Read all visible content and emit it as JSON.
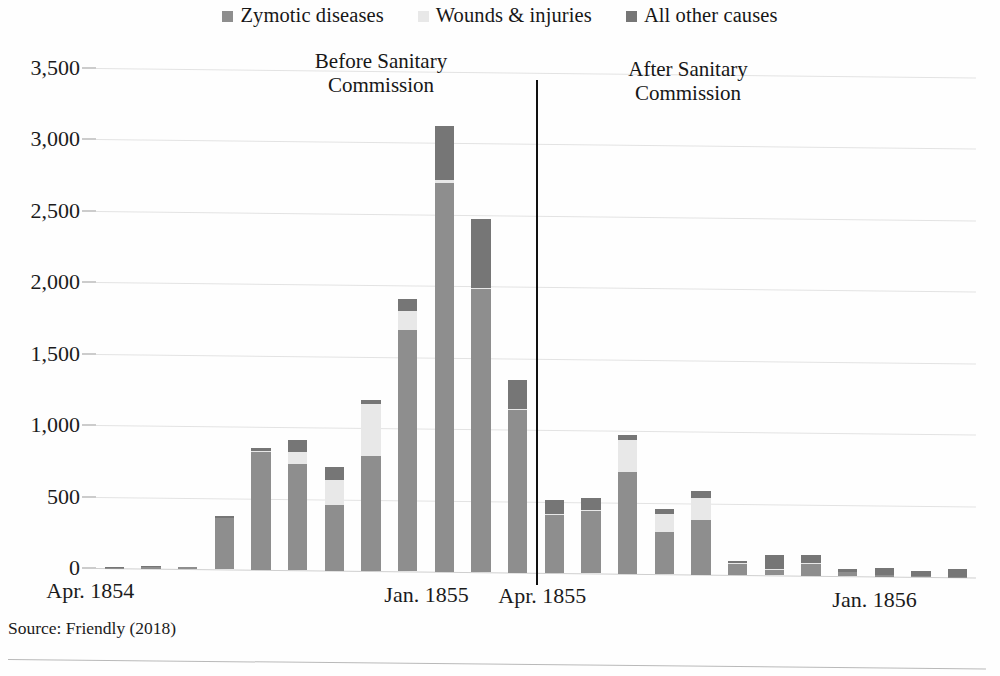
{
  "source_note": "Source: Friendly (2018)",
  "annotations": {
    "before": "Before Sanitary\nCommission",
    "before_line1": "Before Sanitary",
    "before_line2": "Commission",
    "after_line1": "After Sanitary",
    "after_line2": "Commission"
  },
  "colors": {
    "zymotic": "#8e8e8e",
    "wounds": "#e8e8e8",
    "other": "#767676",
    "gridline": "#e3e3e3",
    "divider": "#111111",
    "text": "#1b1b1b"
  },
  "chart_data": {
    "type": "bar",
    "title": "",
    "subtitle": "",
    "xlabel": "",
    "ylabel": "",
    "ylim": [
      0,
      3500
    ],
    "ytick_values": [
      0,
      500,
      1000,
      1500,
      2000,
      2500,
      3000,
      3500
    ],
    "ytick_labels": [
      "0",
      "500",
      "1,000",
      "1,500",
      "2,000",
      "2,500",
      "3,000",
      "3,500"
    ],
    "grid": true,
    "stacked": true,
    "legend_position": "top-center",
    "legend": [
      "Zymotic diseases",
      "Wounds & injuries",
      "All other causes"
    ],
    "categories": [
      "Apr. 1854",
      "May 1854",
      "Jun. 1854",
      "Jul. 1854",
      "Aug. 1854",
      "Sep. 1854",
      "Oct. 1854",
      "Nov. 1854",
      "Dec. 1854",
      "Jan. 1855",
      "Feb. 1855",
      "Mar. 1855",
      "Apr. 1855",
      "May 1855",
      "Jun. 1855",
      "Jul. 1855",
      "Aug. 1855",
      "Sep. 1855",
      "Oct. 1855",
      "Nov. 1855",
      "Dec. 1855",
      "Jan. 1856",
      "Feb. 1856",
      "Mar. 1856"
    ],
    "xtick_labels": [
      "Apr. 1854",
      "Jan. 1855",
      "Apr. 1855",
      "Jan. 1856"
    ],
    "xtick_indices": [
      0,
      9,
      12,
      21
    ],
    "series": [
      {
        "name": "Zymotic diseases",
        "color": "#8e8e8e",
        "values": [
          1,
          12,
          11,
          359,
          828,
          745,
          460,
          806,
          1687,
          2723,
          1981,
          1139,
          409,
          437,
          714,
          298,
          383,
          76,
          37,
          83,
          26,
          10,
          5,
          2
        ]
      },
      {
        "name": "Wounds & injuries",
        "color": "#e8e8e8",
        "values": [
          0,
          0,
          0,
          1,
          4,
          79,
          171,
          366,
          133,
          16,
          11,
          5,
          2,
          2,
          219,
          122,
          156,
          10,
          6,
          4,
          2,
          1,
          1,
          0
        ]
      },
      {
        "name": "All other causes",
        "color": "#767676",
        "values": [
          5,
          9,
          6,
          11,
          19,
          86,
          96,
          24,
          87,
          383,
          477,
          207,
          96,
          83,
          36,
          37,
          43,
          13,
          98,
          56,
          23,
          46,
          33,
          51
        ]
      }
    ],
    "totals": [
      6,
      21,
      17,
      371,
      851,
      910,
      727,
      1196,
      1907,
      3122,
      2469,
      1351,
      507,
      522,
      969,
      457,
      582,
      99,
      141,
      143,
      51,
      57,
      39,
      53
    ],
    "divider": {
      "label_left": "Before Sanitary Commission",
      "label_right": "After Sanitary Commission",
      "after_index": 12
    }
  }
}
